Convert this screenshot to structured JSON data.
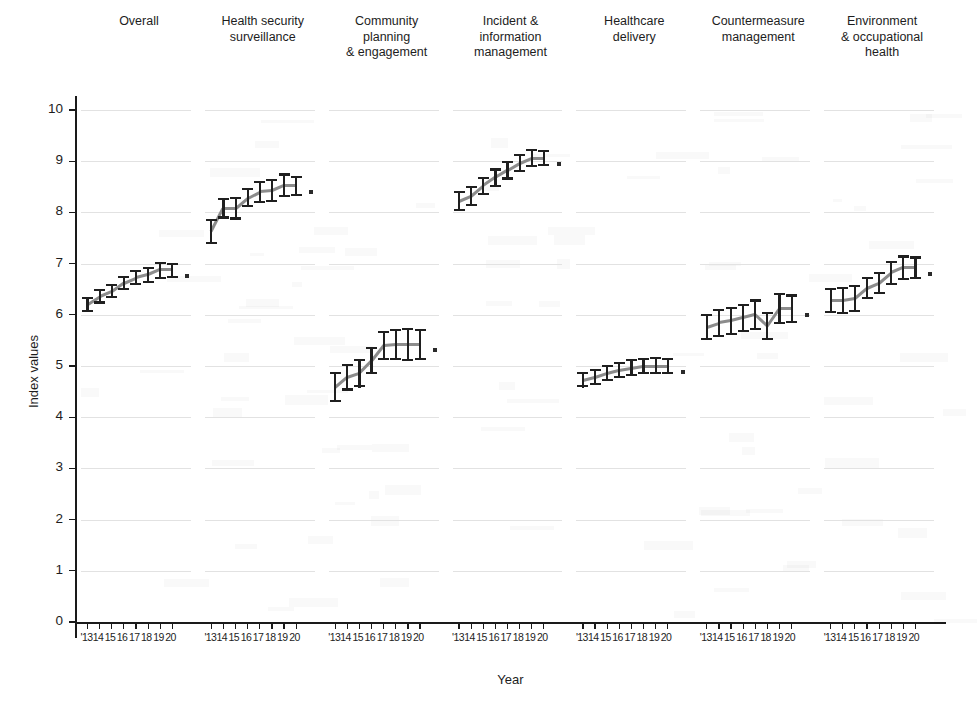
{
  "chart_data": {
    "type": "line",
    "title": "",
    "xlabel": "Year",
    "ylabel": "Index values",
    "ylim": [
      0,
      10
    ],
    "yticks": [
      0,
      1,
      2,
      3,
      4,
      5,
      6,
      7,
      8,
      9,
      10
    ],
    "grid": true,
    "legend": "none",
    "x": [
      "'13",
      "14",
      "15",
      "16",
      "17",
      "18",
      "19",
      "20"
    ],
    "xtick_label_string": "'131415161718 1920",
    "error_bar_note": "black vertical error bars with caps at each point; small square end marker after final point",
    "panels": [
      {
        "name": "Overall",
        "title": "Overall",
        "values": [
          6.2,
          6.35,
          6.45,
          6.62,
          6.72,
          6.78,
          6.88,
          6.88
        ],
        "err_low": [
          6.05,
          6.22,
          6.32,
          6.48,
          6.58,
          6.62,
          6.7,
          6.72
        ],
        "err_high": [
          6.35,
          6.5,
          6.6,
          6.76,
          6.88,
          6.94,
          7.04,
          7.02
        ]
      },
      {
        "name": "Health security surveillance",
        "title": "Health security\nsurveillance",
        "values": [
          7.62,
          8.08,
          8.08,
          8.28,
          8.4,
          8.42,
          8.52,
          8.52
        ],
        "err_low": [
          7.38,
          7.88,
          7.86,
          8.1,
          8.18,
          8.2,
          8.3,
          8.32
        ],
        "err_high": [
          7.88,
          8.28,
          8.3,
          8.48,
          8.62,
          8.66,
          8.76,
          8.72
        ]
      },
      {
        "name": "Community planning & engagement",
        "title": "Community\nplanning\n& engagement",
        "values": [
          4.58,
          4.78,
          4.86,
          5.1,
          5.4,
          5.42,
          5.42,
          5.42
        ],
        "err_low": [
          4.3,
          4.52,
          4.58,
          4.84,
          5.12,
          5.12,
          5.1,
          5.12
        ],
        "err_high": [
          4.88,
          5.04,
          5.14,
          5.38,
          5.68,
          5.72,
          5.74,
          5.72
        ]
      },
      {
        "name": "Incident & information management",
        "title": "Incident &\ninformation\nmanagement",
        "values": [
          8.22,
          8.32,
          8.52,
          8.68,
          8.82,
          8.96,
          9.06,
          9.06
        ],
        "err_low": [
          8.02,
          8.12,
          8.34,
          8.5,
          8.64,
          8.78,
          8.88,
          8.9
        ],
        "err_high": [
          8.42,
          8.52,
          8.7,
          8.86,
          9.0,
          9.14,
          9.24,
          9.22
        ]
      },
      {
        "name": "Healthcare delivery",
        "title": "Healthcare\ndelivery",
        "values": [
          4.72,
          4.78,
          4.86,
          4.92,
          4.96,
          5.0,
          5.0,
          5.0
        ],
        "err_low": [
          4.58,
          4.62,
          4.7,
          4.76,
          4.8,
          4.84,
          4.84,
          4.84
        ],
        "err_high": [
          4.88,
          4.94,
          5.02,
          5.08,
          5.14,
          5.16,
          5.18,
          5.16
        ]
      },
      {
        "name": "Countermeasure management",
        "title": "Countermeasure\nmanagement",
        "values": [
          5.76,
          5.84,
          5.88,
          5.94,
          6.0,
          5.78,
          6.12,
          6.12
        ],
        "err_low": [
          5.5,
          5.56,
          5.6,
          5.66,
          5.7,
          5.5,
          5.82,
          5.84
        ],
        "err_high": [
          6.02,
          6.12,
          6.16,
          6.22,
          6.3,
          6.06,
          6.42,
          6.4
        ]
      },
      {
        "name": "Environment & occupational health",
        "title": "Environment\n& occupational\nhealth",
        "values": [
          6.28,
          6.28,
          6.32,
          6.52,
          6.62,
          6.82,
          6.92,
          6.92
        ],
        "err_low": [
          6.04,
          6.02,
          6.06,
          6.3,
          6.4,
          6.58,
          6.68,
          6.7
        ],
        "err_high": [
          6.52,
          6.54,
          6.58,
          6.74,
          6.84,
          7.06,
          7.16,
          7.14
        ]
      }
    ]
  }
}
